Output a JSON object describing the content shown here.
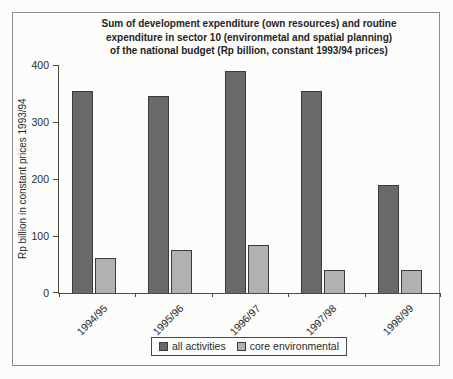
{
  "title_lines": [
    "Sum of development expenditure (own resources) and routine",
    "expenditure in sector 10 (environmetal and spatial planning)",
    "of the national budget (Rp billion, constant 1993/94 prices)"
  ],
  "chart_data": {
    "type": "bar",
    "title": "Sum of development expenditure (own resources) and routine expenditure in sector 10 (environmetal and spatial planning) of the national budget (Rp billion, constant 1993/94 prices)",
    "categories": [
      "1994/95",
      "1995/96",
      "1996/97",
      "1997/98",
      "1998/99"
    ],
    "series": [
      {
        "name": "all activities",
        "values": [
          355,
          345,
          390,
          355,
          190
        ],
        "color": "#696969",
        "border_color": "#3b3b3b"
      },
      {
        "name": "core environmental",
        "values": [
          62,
          76,
          84,
          40,
          40
        ],
        "color": "#b1b1b1",
        "border_color": "#3b3b3b"
      }
    ],
    "xlabel": "",
    "ylabel": "Rp billion in constant prices 1993/94",
    "ylim": [
      0,
      400
    ],
    "yticks": [
      0,
      100,
      200,
      300,
      400
    ],
    "grid": false,
    "legend_position": "bottom-center",
    "axis_color": "#4a4a4a",
    "frame_border_color": "#8e8e8e",
    "background_color": "#fcfcfb"
  }
}
